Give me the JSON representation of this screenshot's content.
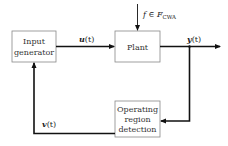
{
  "diagram": {
    "type": "block-diagram",
    "blocks": [
      {
        "id": "input_generator",
        "lines": [
          "Input",
          "generator"
        ]
      },
      {
        "id": "plant",
        "lines": [
          "Plant"
        ]
      },
      {
        "id": "operating_region_detection",
        "lines": [
          "Operating",
          "region",
          "detection"
        ]
      }
    ],
    "signals": {
      "u": {
        "symbol": "u",
        "arg": "(t)",
        "from": "input_generator",
        "to": "plant"
      },
      "y": {
        "symbol": "y",
        "arg": "(t)",
        "from": "plant",
        "to": "output / operating_region_detection"
      },
      "v": {
        "symbol": "v",
        "arg": "(t)",
        "from": "operating_region_detection",
        "to": "input_generator"
      },
      "f": {
        "prefix": "f ∈ ",
        "set": "F",
        "subscript": "CWA",
        "to": "plant"
      }
    },
    "colors": {
      "stroke": "#222222",
      "box_border": "#888888",
      "text": "#333333"
    }
  }
}
